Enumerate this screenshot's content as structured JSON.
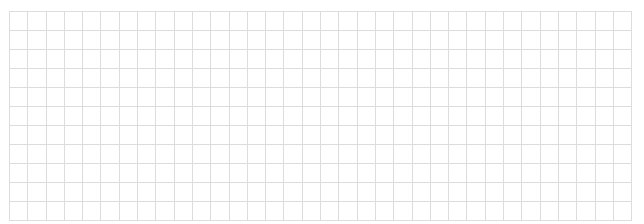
{
  "grid": {
    "rows": 11,
    "columns": 34,
    "line_color": "#dcdcdc",
    "background": "#ffffff",
    "cells_content": "empty"
  }
}
